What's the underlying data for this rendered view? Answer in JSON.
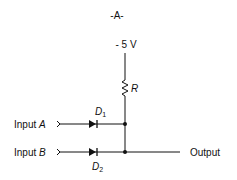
{
  "figure": {
    "label": "-A-",
    "supply": "- 5 V",
    "resistor_label": "R",
    "diodes": [
      {
        "letter": "D",
        "sub": "1"
      },
      {
        "letter": "D",
        "sub": "2"
      }
    ],
    "inputs": [
      {
        "prefix": "Input ",
        "name": "A"
      },
      {
        "prefix": "Input ",
        "name": "B"
      }
    ],
    "output_label": "Output"
  }
}
